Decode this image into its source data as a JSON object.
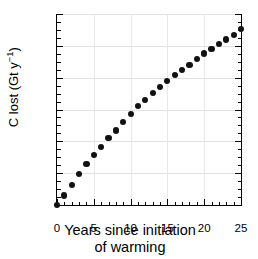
{
  "chart_data": {
    "type": "scatter",
    "title": "",
    "xlabel": "Years since initiation of warming",
    "xlabel_line1": "Years since initiation",
    "xlabel_line2": "of warming",
    "ylabel": "C lost (Gt y-1)",
    "ylabel_main": "C lost (Gt y",
    "ylabel_sup": "−1",
    "ylabel_close": ")",
    "xlim": [
      0,
      25
    ],
    "ylim": [
      0,
      0.6
    ],
    "x_ticks": [
      0,
      5,
      10,
      15,
      20,
      25
    ],
    "x_tick_labels": [
      "0",
      "5",
      "10",
      "15",
      "20",
      "25"
    ],
    "x_minor_interval": 1,
    "y_ticks": [
      0,
      0.1,
      0.2,
      0.3,
      0.4,
      0.5,
      0.6
    ],
    "y_tick_labels": [
      "0",
      "0.1",
      "0.2",
      "0.3",
      "0.4",
      "0.5",
      "0.6"
    ],
    "y_minor_interval": 0.025,
    "grid": true,
    "grid_color": "#e2e2e2",
    "legend": "none",
    "marker": "filled-circle",
    "marker_color": "#111111",
    "marker_size_px": 6.2,
    "x": [
      0,
      1,
      2,
      3,
      4,
      5,
      6,
      7,
      8,
      9,
      10,
      11,
      12,
      13,
      14,
      15,
      16,
      17,
      18,
      19,
      20,
      21,
      22,
      23,
      24,
      25
    ],
    "values": [
      0.0,
      0.03,
      0.064,
      0.098,
      0.128,
      0.156,
      0.183,
      0.21,
      0.234,
      0.26,
      0.287,
      0.311,
      0.331,
      0.351,
      0.371,
      0.39,
      0.408,
      0.424,
      0.44,
      0.459,
      0.476,
      0.49,
      0.505,
      0.52,
      0.535,
      0.553
    ],
    "series": [
      {
        "name": "C lost",
        "values": [
          0.0,
          0.03,
          0.064,
          0.098,
          0.128,
          0.156,
          0.183,
          0.21,
          0.234,
          0.26,
          0.287,
          0.311,
          0.331,
          0.351,
          0.371,
          0.39,
          0.408,
          0.424,
          0.44,
          0.459,
          0.476,
          0.49,
          0.505,
          0.52,
          0.535,
          0.553
        ]
      }
    ]
  }
}
